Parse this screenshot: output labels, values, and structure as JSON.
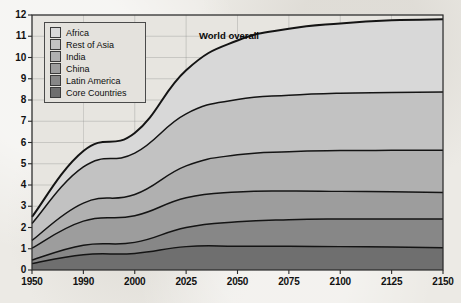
{
  "chart_data": {
    "type": "area",
    "title": "",
    "subtitle": "",
    "xlabel": "",
    "ylabel": "",
    "stacked": true,
    "grid": true,
    "legend_position": "top-left",
    "x_tick_labels": [
      "1950",
      "1990",
      "2000",
      "2025",
      "2050",
      "2075",
      "2100",
      "2125",
      "2150"
    ],
    "x": [
      1950,
      1990,
      2000,
      2025,
      2050,
      2075,
      2100,
      2125,
      2150
    ],
    "y_tick_labels": [
      "0",
      "1",
      "2",
      "3",
      "4",
      "5",
      "6",
      "7",
      "8",
      "9",
      "10",
      "11",
      "12"
    ],
    "ylim": [
      0,
      12
    ],
    "annotations": [
      {
        "text": "World overall",
        "x": 2040,
        "y": 11.3
      }
    ],
    "series": [
      {
        "name": "Core Countries",
        "color": "#6f6f6f",
        "values": [
          0.3,
          0.72,
          0.78,
          1.1,
          1.12,
          1.12,
          1.1,
          1.08,
          1.05
        ]
      },
      {
        "name": "Latin America",
        "color": "#878787",
        "values": [
          0.17,
          0.45,
          0.52,
          0.9,
          1.15,
          1.25,
          1.3,
          1.32,
          1.35
        ]
      },
      {
        "name": "China",
        "color": "#9d9d9d",
        "values": [
          0.56,
          1.13,
          1.25,
          1.4,
          1.4,
          1.35,
          1.3,
          1.28,
          1.25
        ]
      },
      {
        "name": "India",
        "color": "#b0b0b0",
        "values": [
          0.36,
          0.85,
          1.0,
          1.5,
          1.75,
          1.85,
          1.92,
          1.95,
          1.98
        ]
      },
      {
        "name": "Rest of Asia",
        "color": "#c2c2c2",
        "values": [
          0.8,
          1.7,
          1.95,
          2.45,
          2.6,
          2.65,
          2.7,
          2.72,
          2.75
        ]
      },
      {
        "name": "Africa",
        "color": "#d8d8d8",
        "values": [
          0.31,
          0.75,
          0.95,
          2.05,
          2.78,
          3.13,
          3.28,
          3.4,
          3.42
        ]
      }
    ],
    "totals": [
      2.5,
      5.6,
      6.45,
      9.4,
      10.8,
      11.35,
      11.6,
      11.75,
      11.8
    ]
  },
  "legend": {
    "items": [
      {
        "label": "Africa",
        "color": "#d8d8d8"
      },
      {
        "label": "Rest of Asia",
        "color": "#c2c2c2"
      },
      {
        "label": "India",
        "color": "#b0b0b0"
      },
      {
        "label": "China",
        "color": "#9d9d9d"
      },
      {
        "label": "Latin America",
        "color": "#878787"
      },
      {
        "label": "Core Countries",
        "color": "#6f6f6f"
      }
    ]
  },
  "annotation": {
    "world_overall": "World overall"
  },
  "colors": {
    "axis": "#2b2b2b",
    "grid": "#8a8a8a",
    "plot_background": "#e7e5e0",
    "page_background": "#eceae5"
  }
}
